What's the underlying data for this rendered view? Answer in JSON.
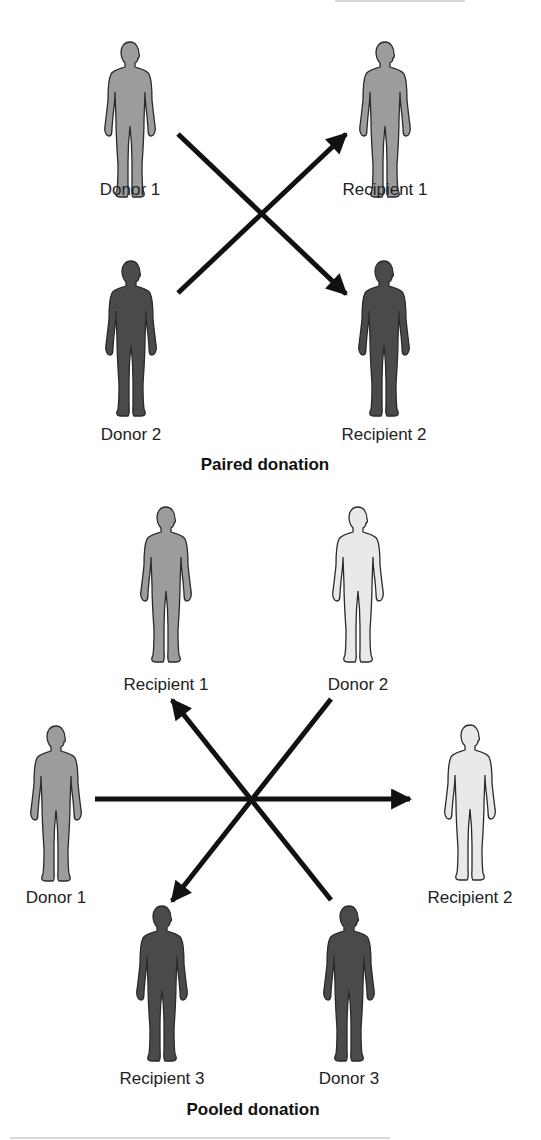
{
  "colors": {
    "light": "#e9e9e9",
    "medium": "#9c9c9c",
    "dark": "#4a4a4a",
    "outline": "#2a2a2a",
    "arrow": "#111111"
  },
  "paired": {
    "title": "Paired donation",
    "title_pos": [
      265,
      455
    ],
    "people": [
      {
        "id": "donor-1",
        "label": "Donor 1",
        "shade": "medium",
        "cx": 130,
        "top": 40,
        "label_y": 180
      },
      {
        "id": "recipient-1",
        "label": "Recipient 1",
        "shade": "medium",
        "cx": 385,
        "top": 40,
        "label_y": 180
      },
      {
        "id": "donor-2",
        "label": "Donor 2",
        "shade": "dark",
        "cx": 131,
        "top": 259,
        "label_y": 425
      },
      {
        "id": "recipient-2",
        "label": "Recipient 2",
        "shade": "dark",
        "cx": 384,
        "top": 259,
        "label_y": 425
      }
    ],
    "arrows": [
      {
        "from": "Donor 1",
        "to": "Recipient 2",
        "x1": 178,
        "y1": 134,
        "x2": 346,
        "y2": 294
      },
      {
        "from": "Donor 2",
        "to": "Recipient 1",
        "x1": 178,
        "y1": 293,
        "x2": 346,
        "y2": 134
      }
    ]
  },
  "pooled": {
    "title": "Pooled donation",
    "title_pos": [
      253,
      1100
    ],
    "people": [
      {
        "id": "recipient-1",
        "label": "Recipient 1",
        "shade": "medium",
        "cx": 166,
        "top": 505,
        "label_y": 675
      },
      {
        "id": "donor-2",
        "label": "Donor 2",
        "shade": "light",
        "cx": 358,
        "top": 505,
        "label_y": 675
      },
      {
        "id": "donor-1",
        "label": "Donor 1",
        "shade": "medium",
        "cx": 56,
        "top": 724,
        "label_y": 888
      },
      {
        "id": "recipient-2",
        "label": "Recipient 2",
        "shade": "light",
        "cx": 470,
        "top": 723,
        "label_y": 888
      },
      {
        "id": "recipient-3",
        "label": "Recipient 3",
        "shade": "dark",
        "cx": 162,
        "top": 904,
        "label_y": 1069
      },
      {
        "id": "donor-3",
        "label": "Donor 3",
        "shade": "dark",
        "cx": 349,
        "top": 904,
        "label_y": 1069
      }
    ],
    "arrows": [
      {
        "from": "Donor 1",
        "to": "Recipient 2",
        "x1": 95,
        "y1": 799,
        "x2": 410,
        "y2": 799
      },
      {
        "from": "Donor 2",
        "to": "Recipient 3",
        "x1": 331,
        "y1": 699,
        "x2": 172,
        "y2": 901
      },
      {
        "from": "Donor 3",
        "to": "Recipient 1",
        "x1": 331,
        "y1": 900,
        "x2": 172,
        "y2": 700
      }
    ]
  }
}
